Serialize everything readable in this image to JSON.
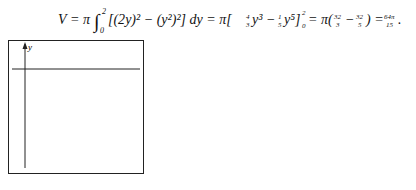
{
  "equation": {
    "text": "V = π∫₀² [(2y)² − (y²)²] dy = π[⅓·4y³ − ⅕y⁵]₀² = π(32/3 − 32/5) = 64π/15.",
    "lhs": "V",
    "integrand": "[(2y)² − (y²)²] dy",
    "antiderivative": "[4/3 y³ − 1/5 y⁵]",
    "evaluated": "π(32/3 − 32/5)",
    "result": "64π/15"
  },
  "figures": [
    {
      "caption": "Figure 17",
      "axes": {
        "x": "x",
        "y": "y"
      },
      "curves": [
        {
          "label": "y = ½x"
        },
        {
          "label": "x = y²"
        }
      ],
      "point": "(4, 2)",
      "shaded_region": true
    },
    {
      "caption": "Figure 18",
      "axes": {
        "x": "x",
        "y": "y"
      },
      "curves": [
        {
          "label": "y = 4x²"
        },
        {
          "label": "y = 2x"
        }
      ],
      "point": "(½, 1)",
      "shaded_region": true
    }
  ]
}
